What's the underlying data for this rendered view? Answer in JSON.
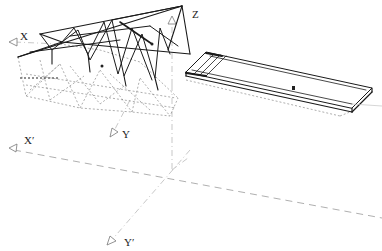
{
  "diagram": {
    "type": "isometric-line-drawing",
    "labels": {
      "x_axis": "X",
      "y_axis": "Y",
      "z_axis": "Z",
      "x_prime_axis": "X′",
      "y_prime_axis": "Y′"
    },
    "colors": {
      "structure": "#1a1a1a",
      "hidden_lines": "#777777",
      "axis_lines": "#9a9a9a",
      "background": "#ffffff"
    }
  }
}
